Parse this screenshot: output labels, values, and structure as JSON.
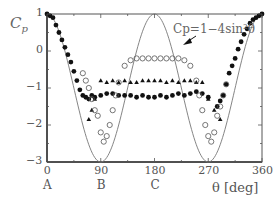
{
  "chart_data": {
    "type": "scatter",
    "title": "",
    "xlabel": "θ [deg]",
    "ylabel": "Cp",
    "xlim": [
      0,
      360
    ],
    "ylim": [
      -3,
      1
    ],
    "xticks": [
      0,
      90,
      180,
      270,
      360
    ],
    "yticks": [
      1,
      0,
      -1,
      -2,
      -3
    ],
    "x_position_labels": [
      {
        "x": 0,
        "label": "A"
      },
      {
        "x": 90,
        "label": "B"
      },
      {
        "x": 180,
        "label": "C"
      }
    ],
    "grid": false,
    "legend": null,
    "annotation": {
      "text": "Cp=1−4sin²θ",
      "points_to_x": 220
    },
    "theory_curve": {
      "name": "Cp=1−4sin²θ",
      "style": "line"
    },
    "series": [
      {
        "name": "filled-circles",
        "marker": "filled-circle",
        "x": [
          0,
          5,
          10,
          15,
          20,
          25,
          30,
          35,
          40,
          45,
          50,
          55,
          60,
          65,
          70,
          75,
          80,
          90,
          100,
          110,
          120,
          130,
          140,
          150,
          160,
          170,
          180,
          190,
          200,
          210,
          220,
          230,
          240,
          250,
          260,
          270,
          285,
          290,
          295,
          300,
          305,
          310,
          315,
          320,
          325,
          330,
          335,
          340,
          345,
          350,
          355,
          360
        ],
        "y": [
          1,
          0.95,
          0.9,
          0.7,
          0.5,
          0.3,
          0.1,
          -0.1,
          -0.3,
          -0.55,
          -0.8,
          -1.05,
          -1.2,
          -1.25,
          -1.3,
          -1.2,
          -1.25,
          -1.2,
          -1.15,
          -1.15,
          -1.2,
          -1.2,
          -1.2,
          -1.25,
          -1.2,
          -1.25,
          -1.25,
          -1.2,
          -1.25,
          -1.2,
          -1.15,
          -1.2,
          -1.15,
          -1.1,
          -1.15,
          -1.25,
          -1.5,
          -1.35,
          -1.2,
          -0.9,
          -0.6,
          -0.4,
          -0.2,
          0.05,
          0.25,
          0.45,
          0.6,
          0.75,
          0.85,
          0.9,
          0.95,
          1
        ]
      },
      {
        "name": "triangles",
        "marker": "filled-triangle",
        "x": [
          70,
          75,
          80,
          90,
          100,
          110,
          120,
          130,
          140,
          150,
          160,
          170,
          180,
          190,
          200,
          210,
          220,
          230,
          240,
          250,
          260,
          270,
          280,
          290
        ],
        "y": [
          -1.85,
          -1.6,
          -1.3,
          -0.8,
          -0.85,
          -0.8,
          -0.85,
          -0.8,
          -0.85,
          -0.85,
          -0.8,
          -0.8,
          -0.8,
          -0.8,
          -0.85,
          -0.8,
          -0.85,
          -0.8,
          -0.8,
          -0.85,
          -0.85,
          -1.3,
          -1.6,
          -1.85
        ]
      },
      {
        "name": "open-circles",
        "marker": "open-circle",
        "x": [
          60,
          65,
          70,
          75,
          80,
          85,
          90,
          95,
          100,
          105,
          110,
          115,
          120,
          130,
          140,
          150,
          160,
          170,
          180,
          190,
          200,
          210,
          220,
          230,
          240,
          250,
          255,
          260,
          265,
          270,
          275,
          280,
          285,
          290,
          295,
          300
        ],
        "y": [
          -0.6,
          -0.8,
          -1.0,
          -1.3,
          -1.6,
          -1.75,
          -2.2,
          -2.45,
          -2.3,
          -2.0,
          -1.6,
          -1.2,
          -0.85,
          -0.4,
          -0.25,
          -0.2,
          -0.2,
          -0.2,
          -0.2,
          -0.2,
          -0.2,
          -0.2,
          -0.2,
          -0.25,
          -0.4,
          -0.8,
          -1.2,
          -1.6,
          -2.0,
          -2.3,
          -2.45,
          -2.2,
          -1.75,
          -1.5,
          -1.2,
          -0.9
        ]
      }
    ]
  }
}
